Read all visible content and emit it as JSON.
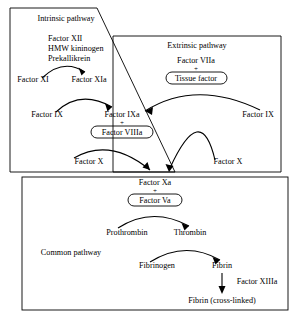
{
  "diagram": {
    "sections": {
      "intrinsic": {
        "label": "Intrinsic pathway"
      },
      "extrinsic": {
        "label": "Extrinsic pathway"
      },
      "common": {
        "label": "Common pathway"
      }
    },
    "nodes": {
      "factor_xii": "Factor XII",
      "hmw_kininogen": "HMW kininogen",
      "prekallikrein": "Prekallikrein",
      "factor_xi": "Factor XI",
      "factor_xia": "Factor XIa",
      "factor_ix_intrinsic": "Factor IX",
      "factor_ixa": "Factor IXa",
      "factor_viiia": "Factor VIIIa",
      "factor_x_intrinsic": "Factor X",
      "factor_viia": "Factor VIIa",
      "tissue_factor": "Tissue factor",
      "factor_ix_extrinsic": "Factor IX",
      "factor_x_extrinsic": "Factor X",
      "factor_xa": "Factor Xa",
      "factor_va": "Factor Va",
      "prothrombin": "Prothrombin",
      "thrombin": "Thrombin",
      "fibrinogen": "Fibrinogen",
      "fibrin": "Fibrin",
      "factor_xiiia": "Factor XIIIa",
      "fibrin_cross_linked": "Fibrin (cross-linked)"
    },
    "symbols": {
      "plus_extrinsic": "+",
      "plus_intrinsic": "+",
      "plus_common": "+"
    },
    "colors": {
      "stroke": "#000000",
      "background": "#ffffff",
      "text": "#000000"
    }
  }
}
